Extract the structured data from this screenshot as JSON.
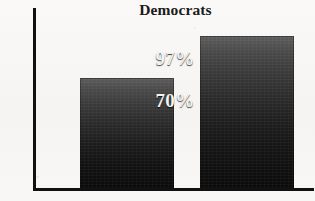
{
  "chart_data": {
    "type": "bar",
    "title": "Democrats",
    "xlabel": "",
    "ylabel": "% Consistently Liberal",
    "categories": [
      "",
      ""
    ],
    "values": [
      70,
      97
    ],
    "value_labels": [
      "70%",
      "97%"
    ],
    "ylim": [
      0,
      115
    ],
    "grid": false,
    "legend": "none",
    "bar_color": "#1b1b1b",
    "value_label_color": "#f2f2f0",
    "axis_color": "#111111",
    "background_color": "#f7f6f4"
  }
}
